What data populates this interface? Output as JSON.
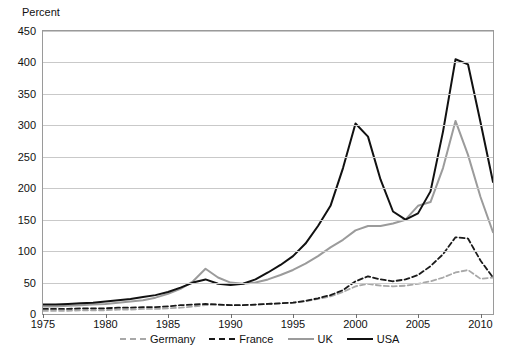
{
  "chart_data": {
    "type": "line",
    "title": "",
    "ylabel": "Percent",
    "xlabel": "",
    "ylim": [
      0,
      450
    ],
    "xlim": [
      1975,
      2011
    ],
    "grid": true,
    "legend_position": "bottom",
    "y_ticks": [
      0,
      50,
      100,
      150,
      200,
      250,
      300,
      350,
      400,
      450
    ],
    "x_ticks": [
      1975,
      1980,
      1985,
      1990,
      1995,
      2000,
      2005,
      2010
    ],
    "x": [
      1975,
      1976,
      1977,
      1978,
      1979,
      1980,
      1981,
      1982,
      1983,
      1984,
      1985,
      1986,
      1987,
      1988,
      1989,
      1990,
      1991,
      1992,
      1993,
      1994,
      1995,
      1996,
      1997,
      1998,
      1999,
      2000,
      2001,
      2002,
      2003,
      2004,
      2005,
      2006,
      2007,
      2008,
      2009,
      2010,
      2011
    ],
    "series": [
      {
        "name": "Germany",
        "color": "#a8a8a8",
        "style": "dashed",
        "values": [
          5,
          5,
          5,
          6,
          6,
          6,
          7,
          7,
          8,
          8,
          9,
          10,
          12,
          14,
          15,
          14,
          14,
          15,
          16,
          17,
          18,
          20,
          24,
          28,
          35,
          44,
          48,
          45,
          44,
          45,
          48,
          52,
          58,
          66,
          70,
          56,
          58
        ]
      },
      {
        "name": "France",
        "color": "#1a1a1a",
        "style": "dashed",
        "values": [
          8,
          8,
          8,
          9,
          9,
          9,
          10,
          10,
          11,
          11,
          12,
          14,
          15,
          16,
          15,
          14,
          14,
          15,
          16,
          17,
          18,
          21,
          25,
          30,
          38,
          52,
          60,
          55,
          52,
          55,
          62,
          76,
          95,
          122,
          120,
          85,
          58
        ]
      },
      {
        "name": "UK",
        "color": "#9b9b9b",
        "style": "solid",
        "values": [
          12,
          12,
          13,
          14,
          15,
          16,
          18,
          20,
          22,
          26,
          32,
          40,
          52,
          72,
          58,
          50,
          48,
          50,
          55,
          62,
          70,
          80,
          92,
          106,
          118,
          133,
          140,
          140,
          144,
          150,
          172,
          178,
          232,
          307,
          253,
          186,
          130
        ]
      },
      {
        "name": "USA",
        "color": "#111111",
        "style": "solid",
        "values": [
          15,
          15,
          16,
          17,
          18,
          20,
          22,
          24,
          27,
          30,
          35,
          42,
          50,
          55,
          48,
          46,
          48,
          55,
          66,
          78,
          92,
          112,
          140,
          172,
          232,
          303,
          282,
          214,
          163,
          150,
          160,
          195,
          290,
          405,
          397,
          305,
          210
        ]
      }
    ]
  }
}
